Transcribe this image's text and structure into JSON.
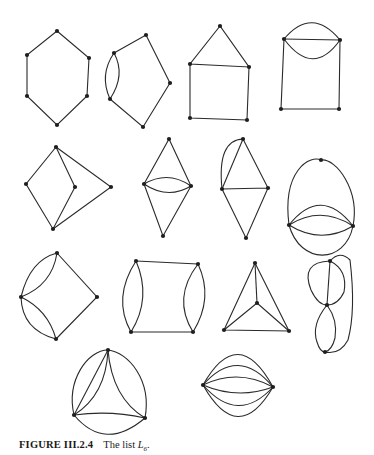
{
  "figure": {
    "caption_label": "FIGURE III.2.4",
    "caption_text": "The list ",
    "caption_var": "L",
    "caption_sub": "6",
    "caption_end": ".",
    "graphs": [
      {
        "id": "hexagon",
        "vertices": [
          [
            57,
            31
          ],
          [
            89,
            58
          ],
          [
            87,
            96
          ],
          [
            57,
            125
          ],
          [
            27,
            96
          ],
          [
            27,
            55
          ]
        ],
        "edges": [
          "M57,31 L89,58 L87,96 L57,125 L27,96 L27,55 Z"
        ]
      },
      {
        "id": "pentagon-double",
        "vertices": [
          [
            146,
            35
          ],
          [
            114,
            53
          ],
          [
            110,
            99
          ],
          [
            143,
            127
          ],
          [
            170,
            83
          ]
        ],
        "edges": [
          "M114,53 L146,35 L170,83 L143,127 L110,99",
          "M114,53 Q99,75 110,99",
          "M114,53 Q126,75 110,99"
        ]
      },
      {
        "id": "house",
        "vertices": [
          [
            220,
            26
          ],
          [
            190,
            64
          ],
          [
            249,
            67
          ],
          [
            190,
            118
          ],
          [
            247,
            120
          ]
        ],
        "edges": [
          "M220,26 L190,64 L249,67 Z",
          "M190,64 L190,118 L247,120 L249,67"
        ]
      },
      {
        "id": "square-triple-top",
        "vertices": [
          [
            284,
            39
          ],
          [
            340,
            40
          ],
          [
            281,
            109
          ],
          [
            339,
            109
          ]
        ],
        "edges": [
          "M284,39 L340,40",
          "M284,39 Q312,6 340,40",
          "M284,39 Q313,78 340,40",
          "M284,39 L281,109 L339,109 L340,40"
        ]
      },
      {
        "id": "kite-k4minus",
        "vertices": [
          [
            56,
            147
          ],
          [
            26,
            184
          ],
          [
            75,
            187
          ],
          [
            111,
            187
          ],
          [
            53,
            229
          ]
        ],
        "edges": [
          "M56,147 L26,184 L53,229 L75,187 Z",
          "M56,147 L111,187 L53,229"
        ]
      },
      {
        "id": "diamond-double",
        "vertices": [
          [
            169,
            139
          ],
          [
            144,
            184
          ],
          [
            191,
            186
          ],
          [
            163,
            236
          ]
        ],
        "edges": [
          "M144,184 L169,139 L191,186 L163,236 Z",
          "M144,184 Q168,170 191,186",
          "M144,184 Q168,200 191,186"
        ]
      },
      {
        "id": "kite-double-arc",
        "vertices": [
          [
            243,
            139
          ],
          [
            222,
            189
          ],
          [
            268,
            188
          ],
          [
            246,
            238
          ]
        ],
        "edges": [
          "M243,139 L268,188 L246,238 L222,189 L268,188",
          "M243,139 L222,189",
          "M243,139 Q217,140 222,189"
        ]
      },
      {
        "id": "egg",
        "vertices": [
          [
            321,
            160
          ],
          [
            289,
            225
          ],
          [
            353,
            226
          ]
        ],
        "edges": [
          "M289,225 C282,170 310,155 321,160",
          "M321,160 C336,158 360,190 353,226",
          "M289,225 Q321,185 353,226",
          "M289,225 Q321,205 353,226",
          "M289,225 Q321,245 353,226",
          "M289,225 C300,265 345,265 353,226"
        ]
      },
      {
        "id": "kite-two-doubles",
        "vertices": [
          [
            57,
            253
          ],
          [
            21,
            297
          ],
          [
            97,
            297
          ],
          [
            56,
            339
          ]
        ],
        "edges": [
          "M57,253 L97,297 L56,339",
          "M21,297 Q30,260 57,253",
          "M21,297 Q52,285 57,253",
          "M21,297 Q48,310 56,339",
          "M21,297 Q22,330 56,339"
        ]
      },
      {
        "id": "square-two-doubles",
        "vertices": [
          [
            136,
            261
          ],
          [
            198,
            264
          ],
          [
            131,
            332
          ],
          [
            193,
            332
          ]
        ],
        "edges": [
          "M136,261 L198,264",
          "M131,332 L193,332",
          "M136,261 Q112,298 131,332",
          "M136,261 Q152,298 131,332",
          "M198,264 Q172,298 193,332",
          "M198,264 Q214,298 193,332"
        ]
      },
      {
        "id": "k4",
        "vertices": [
          [
            255,
            263
          ],
          [
            257,
            303
          ],
          [
            224,
            330
          ],
          [
            289,
            331
          ]
        ],
        "edges": [
          "M255,263 L224,330 L289,331 Z",
          "M255,263 L257,303",
          "M224,330 L257,303 L289,331"
        ]
      },
      {
        "id": "figure-eight",
        "vertices": [
          [
            330,
            261
          ],
          [
            327,
            305
          ],
          [
            325,
            352
          ]
        ],
        "edges": [
          "M330,261 L327,305",
          "M330,261 Q300,262 311,290 Q318,305 327,305",
          "M330,261 Q348,270 344,292 Q338,305 327,305",
          "M327,305 Q311,325 317,342 Q320,352 325,352",
          "M327,305 Q338,320 335,338 Q332,350 325,352",
          "M330,261 Q340,250 350,260 Q356,310 348,340 Q340,355 325,352"
        ]
      },
      {
        "id": "triangle-doubles",
        "vertices": [
          [
            108,
            350
          ],
          [
            74,
            415
          ],
          [
            145,
            418
          ]
        ],
        "edges": [
          "M74,415 L108,350",
          "M108,350 Q106,395 74,415",
          "M108,350 C88,350 66,380 74,415",
          "M108,350 Q112,398 145,418",
          "M108,350 C128,352 152,380 145,418",
          "M74,415 Q110,410 145,418",
          "M74,415 Q105,452 145,418"
        ]
      },
      {
        "id": "sextuple-edge",
        "vertices": [
          [
            203,
            385
          ],
          [
            273,
            387
          ]
        ],
        "edges": [
          "M203,385 Q238,323 273,387",
          "M203,385 Q238,345 273,387",
          "M203,385 Q238,368 273,387",
          "M203,385 Q238,400 273,387",
          "M203,385 Q238,425 273,387",
          "M203,385 Q238,447 273,387"
        ]
      }
    ]
  }
}
